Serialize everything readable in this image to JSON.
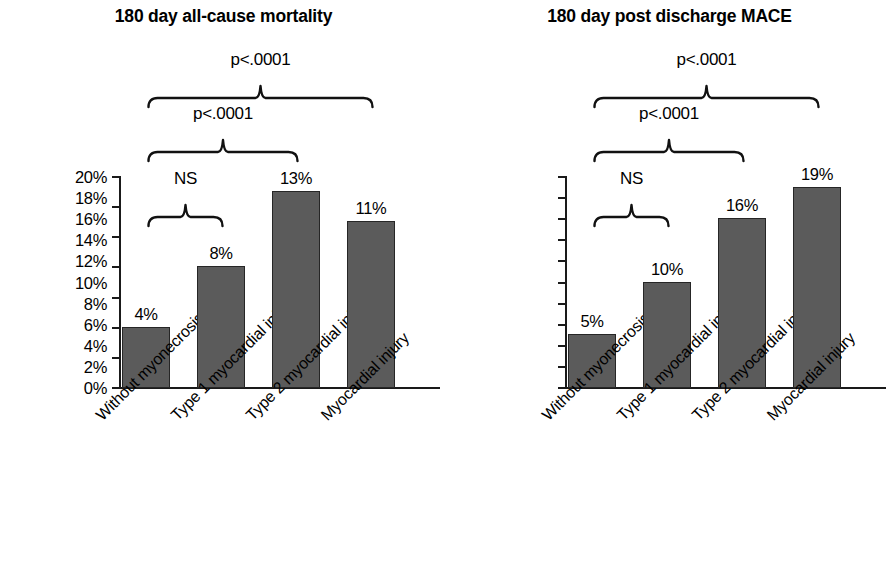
{
  "figure": {
    "background": "#ffffff",
    "bar_color": "#5b5b5b",
    "bar_edge_color": "#262626",
    "axis_color": "#1a1a1a"
  },
  "categories": [
    "Without myonecrosis",
    "Type 1 myocardial infarction",
    "Type 2 myocardial infarction",
    "Myocardial injury"
  ],
  "panels": [
    {
      "id": "all-cause-mortality",
      "title": "180 day all-cause mortality",
      "ylabels": [
        "0%",
        "2%",
        "4%",
        "6%",
        "8%",
        "10%",
        "12%",
        "14%"
      ],
      "bar_labels": [
        "4%",
        "8%",
        "13%",
        "11%"
      ],
      "significance": [
        {
          "text": "p<.0001",
          "from": 0,
          "to": 3
        },
        {
          "text": "p<.0001",
          "from": 0,
          "to": 2
        },
        {
          "text": "NS",
          "from": 0,
          "to": 1
        }
      ]
    },
    {
      "id": "post-discharge-mace",
      "title": "180 day post discharge MACE",
      "ylabels": [
        "0%",
        "2%",
        "4%",
        "6%",
        "8%",
        "10%",
        "12%",
        "14%",
        "16%",
        "18%",
        "20%"
      ],
      "bar_labels": [
        "5%",
        "10%",
        "16%",
        "19%"
      ],
      "significance": [
        {
          "text": "p<.0001",
          "from": 0,
          "to": 3
        },
        {
          "text": "p<.0001",
          "from": 0,
          "to": 2
        },
        {
          "text": "NS",
          "from": 0,
          "to": 1
        }
      ]
    }
  ],
  "chart_data": [
    {
      "type": "bar",
      "title": "180 day all-cause mortality",
      "xlabel": "",
      "ylabel": "",
      "categories": [
        "Without myonecrosis",
        "Type 1 myocardial infarction",
        "Type 2 myocardial infarction",
        "Myocardial injury"
      ],
      "values": [
        4,
        8,
        13,
        11
      ],
      "value_labels": [
        "4%",
        "8%",
        "13%",
        "11%"
      ],
      "ylim": [
        0,
        14
      ],
      "ytick_step": 2,
      "yticks": [
        0,
        2,
        4,
        6,
        8,
        10,
        12,
        14
      ],
      "ytick_labels": [
        "0%",
        "2%",
        "4%",
        "6%",
        "8%",
        "10%",
        "12%",
        "14%"
      ],
      "units": "percent",
      "grid": false,
      "legend": false,
      "annotations": [
        {
          "text": "p<.0001",
          "compares": [
            "Without myonecrosis",
            "Myocardial injury"
          ]
        },
        {
          "text": "p<.0001",
          "compares": [
            "Without myonecrosis",
            "Type 2 myocardial infarction"
          ]
        },
        {
          "text": "NS",
          "compares": [
            "Without myonecrosis",
            "Type 1 myocardial infarction"
          ]
        }
      ]
    },
    {
      "type": "bar",
      "title": "180 day post discharge MACE",
      "xlabel": "",
      "ylabel": "",
      "categories": [
        "Without myonecrosis",
        "Type 1 myocardial infarction",
        "Type 2 myocardial infarction",
        "Myocardial injury"
      ],
      "values": [
        5,
        10,
        16,
        19
      ],
      "value_labels": [
        "5%",
        "10%",
        "16%",
        "19%"
      ],
      "ylim": [
        0,
        20
      ],
      "ytick_step": 2,
      "yticks": [
        0,
        2,
        4,
        6,
        8,
        10,
        12,
        14,
        16,
        18,
        20
      ],
      "ytick_labels": [
        "0%",
        "2%",
        "4%",
        "6%",
        "8%",
        "10%",
        "12%",
        "14%",
        "16%",
        "18%",
        "20%"
      ],
      "units": "percent",
      "grid": false,
      "legend": false,
      "annotations": [
        {
          "text": "p<.0001",
          "compares": [
            "Without myonecrosis",
            "Myocardial injury"
          ]
        },
        {
          "text": "p<.0001",
          "compares": [
            "Without myonecrosis",
            "Type 2 myocardial infarction"
          ]
        },
        {
          "text": "NS",
          "compares": [
            "Without myonecrosis",
            "Type 1 myocardial infarction"
          ]
        }
      ]
    }
  ]
}
